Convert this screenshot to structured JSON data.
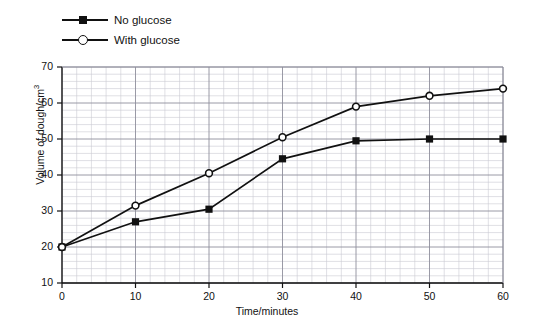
{
  "chart_data": {
    "type": "line",
    "title": "",
    "xlabel": "Time/minutes",
    "ylabel": "Volume of dough/cm3",
    "ylabel_display": "Volume of dough/cm",
    "ylabel_superscript": "3",
    "x": [
      0,
      10,
      20,
      30,
      40,
      50,
      60
    ],
    "xlim": [
      0,
      60
    ],
    "ylim": [
      10,
      70
    ],
    "xticks": [
      "0",
      "10",
      "20",
      "30",
      "40",
      "50",
      "60"
    ],
    "yticks": [
      "10",
      "20",
      "30",
      "40",
      "50",
      "60",
      "70"
    ],
    "grid": true,
    "grid_minor_step_x": 2,
    "grid_minor_step_y": 2,
    "grid_major_step_x": 10,
    "grid_major_step_y": 10,
    "legend_position": "top-left-outside",
    "series": [
      {
        "name": "No glucose",
        "marker": "filled-square",
        "color": "#111111",
        "values": [
          20,
          27,
          30.5,
          44.5,
          49.5,
          50,
          50
        ]
      },
      {
        "name": "With glucose",
        "marker": "open-circle",
        "color": "#111111",
        "values": [
          20,
          31.5,
          40.5,
          50.5,
          59,
          62,
          64
        ]
      }
    ]
  },
  "legend": {
    "items": [
      {
        "label": "No glucose",
        "marker": "filled-square"
      },
      {
        "label": "With glucose",
        "marker": "open-circle"
      }
    ]
  },
  "colors": {
    "ink": "#111111",
    "grid_minor": "#c9c9d2",
    "grid_major": "#8e8e9c",
    "background": "#ffffff"
  }
}
